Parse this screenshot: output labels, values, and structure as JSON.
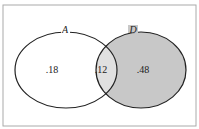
{
  "diagram": {
    "type": "venn",
    "sets": [
      {
        "label": "A",
        "fill": "#ffffff"
      },
      {
        "label": "D",
        "fill": "#c8c8c8"
      }
    ],
    "regions": {
      "a_only": ".18",
      "intersection": ".12",
      "d_only": ".48"
    },
    "colors": {
      "border": "#222222",
      "frame": "#aaaaaa",
      "d_fill": "#c8c8c8",
      "intersection_fill": "#e0e0e0"
    }
  }
}
